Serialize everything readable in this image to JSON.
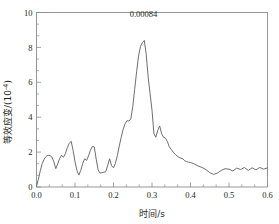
{
  "chart_data": {
    "type": "line",
    "title": "",
    "xlabel": "时间/s",
    "ylabel": "等效应变/(10",
    "ylabel_exponent": "-4",
    "ylabel_suffix": ")",
    "xlim": [
      0.0,
      0.6
    ],
    "ylim": [
      0,
      10
    ],
    "xticks": [
      "0.0",
      "0.1",
      "0.2",
      "0.3",
      "0.4",
      "0.5",
      "0.6"
    ],
    "xtick_values": [
      0.0,
      0.1,
      0.2,
      0.3,
      0.4,
      0.5,
      0.6
    ],
    "ytick_values": [
      0,
      2,
      4,
      6,
      8,
      10
    ],
    "yticks": [
      "0",
      "2",
      "4",
      "6",
      "8",
      "10"
    ],
    "x_minor_per_major": 2,
    "y_minor_per_major": 2,
    "grid": false,
    "legend": null,
    "line_color": "#6e6e6e",
    "annotations": [
      {
        "text": "0.00084",
        "x": 0.278,
        "y": 8.4,
        "dy_units": 1.35
      }
    ],
    "series": [
      {
        "name": "equivalent-strain",
        "x": [
          0.0,
          0.005,
          0.01,
          0.015,
          0.02,
          0.025,
          0.03,
          0.035,
          0.04,
          0.045,
          0.05,
          0.055,
          0.06,
          0.065,
          0.07,
          0.075,
          0.08,
          0.085,
          0.09,
          0.095,
          0.1,
          0.105,
          0.11,
          0.115,
          0.12,
          0.125,
          0.13,
          0.135,
          0.14,
          0.145,
          0.15,
          0.155,
          0.16,
          0.165,
          0.17,
          0.175,
          0.18,
          0.185,
          0.19,
          0.195,
          0.2,
          0.205,
          0.21,
          0.215,
          0.22,
          0.225,
          0.23,
          0.235,
          0.24,
          0.245,
          0.25,
          0.255,
          0.26,
          0.265,
          0.27,
          0.275,
          0.28,
          0.285,
          0.29,
          0.295,
          0.3,
          0.305,
          0.31,
          0.315,
          0.32,
          0.325,
          0.33,
          0.335,
          0.34,
          0.345,
          0.35,
          0.355,
          0.36,
          0.365,
          0.37,
          0.375,
          0.38,
          0.385,
          0.39,
          0.395,
          0.4,
          0.41,
          0.42,
          0.43,
          0.44,
          0.45,
          0.46,
          0.47,
          0.48,
          0.49,
          0.5,
          0.51,
          0.52,
          0.53,
          0.54,
          0.55,
          0.56,
          0.57,
          0.58,
          0.59,
          0.6
        ],
        "y": [
          0.05,
          0.45,
          0.95,
          1.35,
          1.6,
          1.75,
          1.82,
          1.8,
          1.72,
          1.45,
          1.05,
          1.32,
          1.62,
          1.82,
          1.7,
          1.92,
          2.25,
          2.5,
          2.62,
          2.1,
          1.45,
          0.95,
          0.68,
          0.95,
          1.35,
          1.62,
          1.52,
          1.78,
          2.1,
          2.32,
          2.3,
          1.6,
          0.98,
          0.8,
          0.82,
          0.85,
          0.88,
          1.25,
          1.62,
          1.22,
          1.1,
          1.35,
          1.8,
          2.35,
          2.85,
          3.3,
          3.62,
          3.8,
          3.78,
          3.9,
          4.6,
          5.6,
          6.6,
          7.5,
          8.05,
          8.28,
          8.4,
          7.6,
          6.3,
          5.35,
          4.4,
          3.05,
          2.85,
          3.25,
          3.5,
          3.05,
          2.85,
          2.8,
          2.6,
          2.3,
          2.15,
          2.0,
          1.88,
          1.78,
          1.7,
          1.65,
          1.62,
          1.5,
          1.45,
          1.42,
          1.4,
          1.32,
          1.2,
          1.12,
          1.0,
          0.82,
          0.72,
          0.8,
          0.95,
          1.05,
          1.02,
          0.92,
          1.08,
          1.0,
          1.12,
          0.95,
          1.1,
          0.98,
          1.12,
          1.02,
          1.1
        ]
      }
    ]
  }
}
